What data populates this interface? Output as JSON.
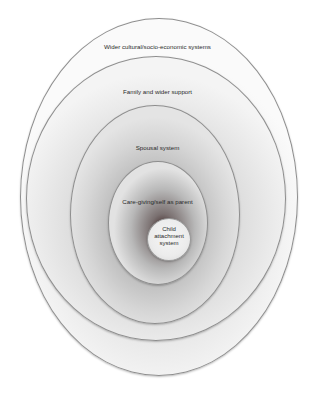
{
  "diagram": {
    "type": "nested-ellipses",
    "layers": [
      {
        "id": "outer",
        "label": "Wider cultural/socio-economic systems"
      },
      {
        "id": "family",
        "label": "Family and wider support"
      },
      {
        "id": "spousal",
        "label": "Spousal system"
      },
      {
        "id": "care",
        "label": "Care-giving/self as parent"
      },
      {
        "id": "child",
        "label_lines": [
          "Child",
          "attachment",
          "system"
        ]
      }
    ],
    "colors": {
      "outline": "#8e8e8e",
      "text": "#2a2a2a",
      "center_dark": "#3a2222"
    }
  }
}
